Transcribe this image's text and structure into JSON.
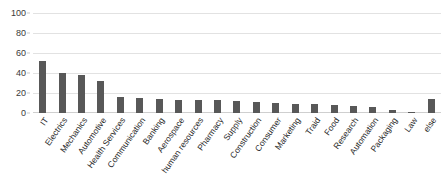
{
  "chart_data": {
    "type": "bar",
    "title": "",
    "subtitle": "",
    "xlabel": "",
    "ylabel": "",
    "ylim": [
      0,
      100
    ],
    "yticks": [
      0,
      20,
      40,
      60,
      80,
      100
    ],
    "grid": true,
    "legend": false,
    "legend_position": "none",
    "bar_color": "#585858",
    "gridline_color": "#e2e2e2",
    "categories": [
      "IT",
      "Electrics",
      "Mechanics",
      "Automotive",
      "Health Services",
      "Communication",
      "Banking",
      "Aerospace",
      "human resources",
      "Pharmacy",
      "Supply",
      "Construction",
      "Consumer",
      "Marketing",
      "Traid",
      "Food",
      "Research",
      "Automation",
      "Packaging",
      "Law",
      "else"
    ],
    "values": [
      52,
      40,
      38,
      32,
      16,
      15,
      14,
      13,
      13,
      13,
      12,
      11,
      10,
      9,
      9,
      8,
      7,
      6,
      3,
      1,
      14
    ]
  }
}
